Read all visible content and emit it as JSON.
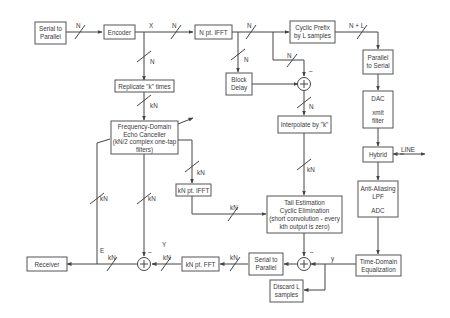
{
  "diagram": {
    "type": "block-diagram",
    "blocks": {
      "serial_to_parallel_tx": [
        "Serial to",
        "Parallel"
      ],
      "encoder": [
        "Encoder"
      ],
      "n_ifft": [
        "N pt. IFFT"
      ],
      "cyclic_prefix": [
        "Cyclic Prefix",
        "by L samples"
      ],
      "parallel_to_serial": [
        "Parallel",
        "to Serial"
      ],
      "dac": [
        "DAC",
        "",
        "xmit",
        "filter"
      ],
      "hybrid": [
        "Hybrid"
      ],
      "aa_lpf_adc": [
        "Anti-Aliasing",
        "LPF",
        "",
        "ADC"
      ],
      "tdeq": [
        "Time-Domain",
        "Equalization"
      ],
      "replicate": [
        "Replicate \"k\" times"
      ],
      "block_delay": [
        "Block",
        "Delay"
      ],
      "interpolate": [
        "Interpolate by \"k\""
      ],
      "fdec": [
        "Frequency-Domain",
        "Echo Canceller",
        "(kN/2 complex one-tap",
        "filters)"
      ],
      "kn_ifft": [
        "kN pt. IFFT"
      ],
      "tail_est": [
        "Tail Estimation",
        "Cyclic Elimination",
        "(short convolution - every",
        "kth output is zero)"
      ],
      "serial_to_parallel_rx": [
        "Serial to",
        "Parallel"
      ],
      "discard": [
        "Discard L",
        "samples"
      ],
      "kn_fft": [
        "kN pt. FFT"
      ],
      "receiver": [
        "Receiver"
      ]
    },
    "labels": {
      "n": "N",
      "x": "X",
      "n_plus_l": "N + L",
      "kn": "kN",
      "line": "LINE",
      "minus": "–",
      "y_upper": "Y",
      "y_lower": "y",
      "e": "E",
      "plus": "+"
    }
  }
}
